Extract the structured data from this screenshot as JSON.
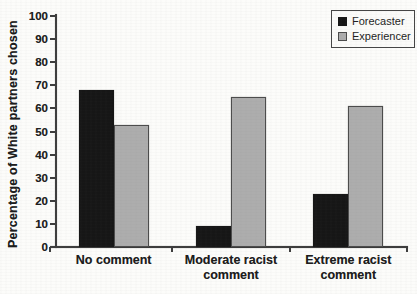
{
  "figure": {
    "background": "#fcfcfa",
    "axis_color": "#3d3d3d",
    "text_color": "#1c1c1c"
  },
  "chart_data": {
    "type": "bar",
    "title": "",
    "xlabel": "",
    "ylabel": "Percentage of White partners chosen",
    "ylim": [
      0,
      100
    ],
    "yticks": [
      0,
      10,
      20,
      30,
      40,
      50,
      60,
      70,
      80,
      90,
      100
    ],
    "grid": false,
    "legend_position": "top-right",
    "categories": [
      "No comment",
      "Moderate racist comment",
      "Extreme racist comment"
    ],
    "series": [
      {
        "name": "Forecaster",
        "color": "#161616",
        "border_color": "#161616",
        "values": [
          68,
          9,
          23
        ]
      },
      {
        "name": "Experiencer",
        "color": "#adadad",
        "border_color": "#4c4c4c",
        "values": [
          53,
          65,
          61
        ]
      }
    ]
  }
}
